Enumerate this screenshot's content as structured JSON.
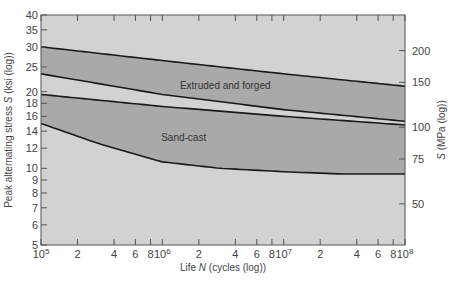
{
  "chart_data": {
    "type": "area",
    "title": "",
    "xlabel": "Life N (cycles (log))",
    "ylabel": "Peak alternating stress S (ksi (log))",
    "ylabel_right": "S (MPa (log))",
    "xscale": "log",
    "yscale": "log",
    "xlim": [
      100000,
      100000000
    ],
    "ylim": [
      5,
      40
    ],
    "grid": false,
    "legend": "none",
    "x_ticks": [
      {
        "value": 100000,
        "label": "10^5",
        "major": true
      },
      {
        "value": 200000,
        "label": "2"
      },
      {
        "value": 400000,
        "label": "4"
      },
      {
        "value": 600000,
        "label": "6"
      },
      {
        "value": 800000,
        "label": "8"
      },
      {
        "value": 1000000,
        "label": "10^6",
        "major": true
      },
      {
        "value": 2000000,
        "label": "2"
      },
      {
        "value": 4000000,
        "label": "4"
      },
      {
        "value": 6000000,
        "label": "6"
      },
      {
        "value": 8000000,
        "label": "8"
      },
      {
        "value": 10000000,
        "label": "10^7",
        "major": true
      },
      {
        "value": 20000000,
        "label": "2"
      },
      {
        "value": 40000000,
        "label": "4"
      },
      {
        "value": 60000000,
        "label": "6"
      },
      {
        "value": 80000000,
        "label": "8"
      },
      {
        "value": 100000000,
        "label": "10^8",
        "major": true
      }
    ],
    "y_ticks_left": [
      5,
      6,
      7,
      8,
      9,
      10,
      12,
      14,
      16,
      18,
      20,
      25,
      30,
      35,
      40
    ],
    "y_ticks_right_mpa": [
      50,
      75,
      100,
      150,
      200
    ],
    "series": [
      {
        "name": "Extruded and forged",
        "label": "Extruded and forged",
        "upper": {
          "x": [
            100000,
            1000000,
            10000000,
            100000000
          ],
          "y": [
            30,
            26.5,
            23.5,
            21
          ]
        },
        "lower": {
          "x": [
            100000,
            1000000,
            10000000,
            100000000
          ],
          "y": [
            23.5,
            19.5,
            17,
            15.3
          ]
        }
      },
      {
        "name": "Sand-cast",
        "label": "Sand-cast",
        "upper": {
          "x": [
            100000,
            1000000,
            10000000,
            100000000
          ],
          "y": [
            19.5,
            17.5,
            16,
            14.8
          ]
        },
        "lower": {
          "x": [
            100000,
            300000,
            1000000,
            3000000,
            10000000,
            30000000,
            100000000
          ],
          "y": [
            15,
            12.5,
            10.6,
            10,
            9.7,
            9.5,
            9.5
          ]
        }
      }
    ]
  },
  "axes": {
    "x_title_prefix": "Life ",
    "x_title_var": "N",
    "x_title_suffix": " (cycles (log))",
    "y_title_prefix": "Peak alternating stress ",
    "y_title_var": "S",
    "y_title_suffix": " (ksi (log))",
    "y2_title_var": "S",
    "y2_title_suffix": " (MPa (log))"
  },
  "colors": {
    "background_plot": "#d2d2d2",
    "band_fill": "#a9a9a9",
    "curve": "#1a1a1a",
    "frame": "#555555",
    "text": "#444444"
  }
}
